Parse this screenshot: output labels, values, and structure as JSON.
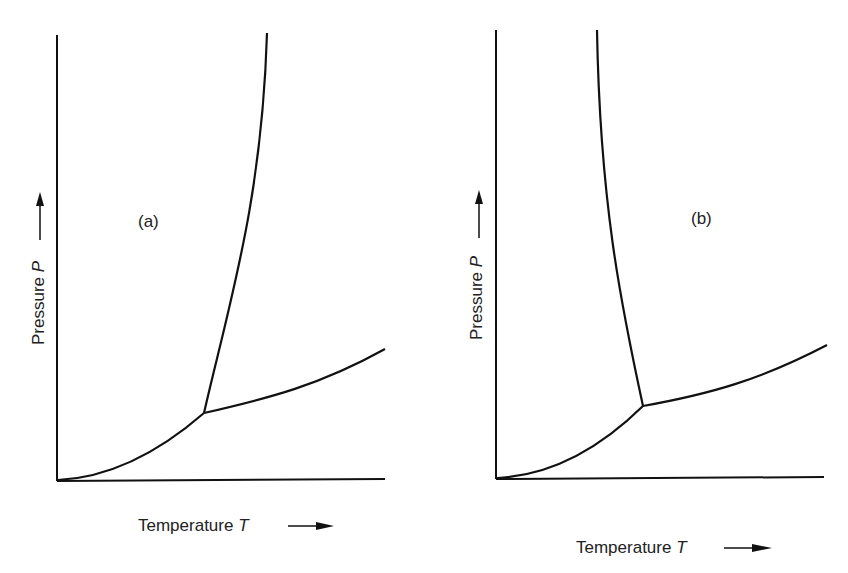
{
  "panels": [
    {
      "id": "a",
      "label": "(a)",
      "xlabel": "Temperature",
      "xsym": "T",
      "ylabel": "Pressure",
      "ysym": "P"
    },
    {
      "id": "b",
      "label": "(b)",
      "xlabel": "Temperature",
      "xsym": "T",
      "ylabel": "Pressure",
      "ysym": "P"
    }
  ],
  "colors": {
    "line": "#111111",
    "background": "#ffffff"
  }
}
